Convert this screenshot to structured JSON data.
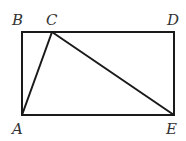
{
  "diagram": {
    "type": "geometry",
    "points": {
      "A": {
        "label": "A",
        "x": 22,
        "y": 115
      },
      "B": {
        "label": "B",
        "x": 22,
        "y": 32
      },
      "C": {
        "label": "C",
        "x": 52,
        "y": 32
      },
      "D": {
        "label": "D",
        "x": 174,
        "y": 32
      },
      "E": {
        "label": "E",
        "x": 174,
        "y": 115
      }
    },
    "label_positions": {
      "A": {
        "x": 12,
        "y": 134
      },
      "B": {
        "x": 12,
        "y": 25
      },
      "C": {
        "x": 46,
        "y": 25
      },
      "D": {
        "x": 167,
        "y": 25
      },
      "E": {
        "x": 166,
        "y": 134
      }
    },
    "segments": [
      {
        "from": "A",
        "to": "B"
      },
      {
        "from": "B",
        "to": "D"
      },
      {
        "from": "D",
        "to": "E"
      },
      {
        "from": "E",
        "to": "A"
      },
      {
        "from": "A",
        "to": "C"
      },
      {
        "from": "C",
        "to": "E"
      }
    ],
    "colors": {
      "line": "#1a1a1a",
      "label": "#333333",
      "background": "#ffffff"
    }
  }
}
